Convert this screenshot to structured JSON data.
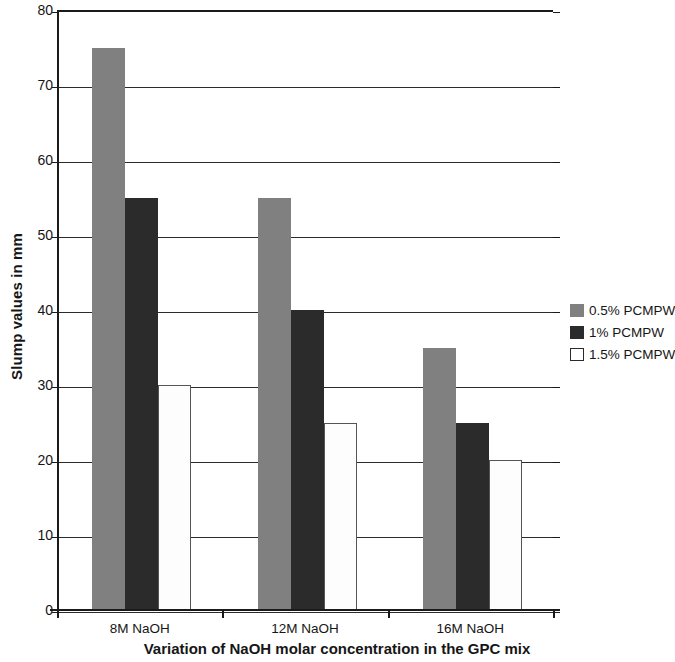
{
  "chart_data": {
    "type": "bar",
    "title": "",
    "xlabel": "Variation of NaOH molar concentration in the GPC mix",
    "ylabel": "Slump values in mm",
    "categories": [
      "8M NaOH",
      "12M NaOH",
      "16M NaOH"
    ],
    "series": [
      {
        "name": "0.5% PCMPW",
        "color": "#808080",
        "values": [
          75,
          55,
          35
        ]
      },
      {
        "name": "1% PCMPW",
        "color": "#2b2b2b",
        "values": [
          55,
          40,
          25
        ]
      },
      {
        "name": "1.5% PCMPW",
        "color": "#ffffff",
        "values": [
          30,
          25,
          20
        ]
      }
    ],
    "ylim": [
      0,
      80
    ],
    "ytick_step": 10,
    "yticks": [
      "80",
      "70",
      "60",
      "50",
      "40",
      "30",
      "20",
      "10",
      "0"
    ],
    "grid": true,
    "legend_position": "right"
  },
  "legend": {
    "entries": [
      {
        "label": "0.5% PCMPW"
      },
      {
        "label": "1% PCMPW"
      },
      {
        "label": "1.5% PCMPW"
      }
    ]
  }
}
